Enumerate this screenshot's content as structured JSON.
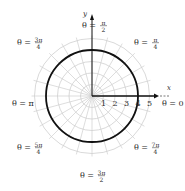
{
  "chart_data": {
    "type": "line",
    "coordinate_system": "polar",
    "title": "",
    "curve": {
      "name": "r = 4",
      "equation": "r = 4",
      "r": 4,
      "theta_range": [
        0,
        "2π"
      ],
      "color": "#111111"
    },
    "grid": {
      "on": true,
      "radial_circles": [
        1,
        2,
        3,
        4,
        5
      ],
      "angular_step_degrees": 15,
      "color": "#cfcfcf"
    },
    "axes": {
      "xlabel": "x",
      "ylabel": "y",
      "r_tick_labels": [
        "1",
        "2",
        "3",
        "4",
        "5"
      ],
      "rlim": [
        0,
        5
      ]
    },
    "angle_labels": [
      {
        "id": "0",
        "prefix": "θ = ",
        "value": "0"
      },
      {
        "id": "pi_4",
        "prefix": "θ = ",
        "num": "π",
        "den": "4"
      },
      {
        "id": "pi_2",
        "prefix": "θ = ",
        "num": "π",
        "den": "2"
      },
      {
        "id": "3pi_4",
        "prefix": "θ = ",
        "num": "3π",
        "den": "4"
      },
      {
        "id": "pi",
        "prefix": "θ = ",
        "value": "π"
      },
      {
        "id": "5pi_4",
        "prefix": "θ = ",
        "num": "5π",
        "den": "4"
      },
      {
        "id": "3pi_2",
        "prefix": "θ = ",
        "num": "3π",
        "den": "2"
      },
      {
        "id": "7pi_4",
        "prefix": "θ = ",
        "num": "7π",
        "den": "4"
      }
    ]
  }
}
